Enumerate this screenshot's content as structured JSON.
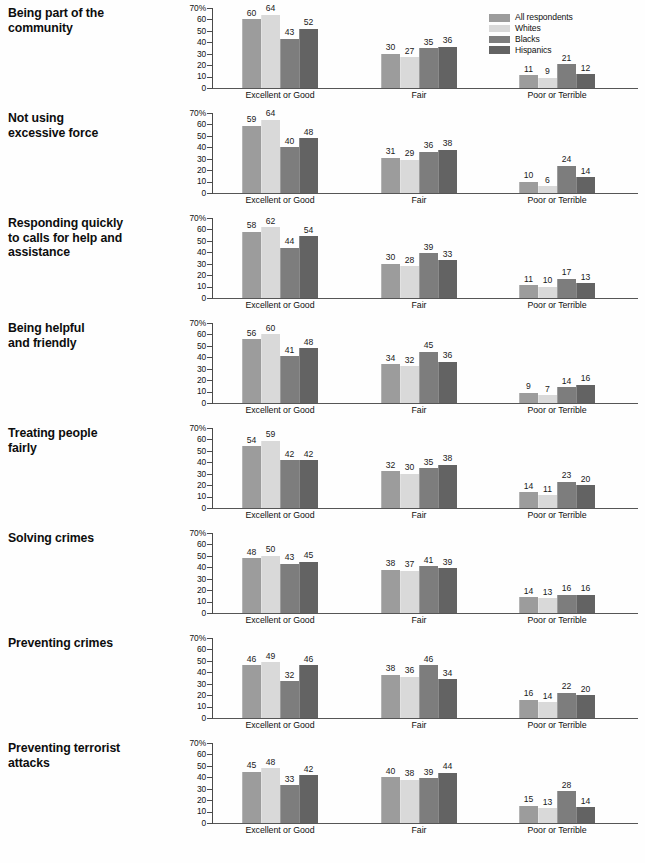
{
  "legend": {
    "items": [
      {
        "label": "All respondents",
        "color": "#9c9c9c"
      },
      {
        "label": "Whites",
        "color": "#d9d9d9"
      },
      {
        "label": "Blacks",
        "color": "#7d7d7d"
      },
      {
        "label": "Hispanics",
        "color": "#636363"
      }
    ]
  },
  "axis": {
    "ticks": [
      "70%",
      "60",
      "50",
      "40",
      "30",
      "20",
      "10",
      "0"
    ],
    "max": 70,
    "min": 0
  },
  "categories": [
    "Excellent or Good",
    "Fair",
    "Poor or Terrible"
  ],
  "chart_data": {
    "type": "bar",
    "title": "",
    "xlabel": "",
    "ylabel": "",
    "ylim": [
      0,
      70
    ],
    "grid": false,
    "legend_position": "top-right",
    "categories": [
      "Excellent or Good",
      "Fair",
      "Poor or Terrible"
    ],
    "series_names": [
      "All respondents",
      "Whites",
      "Blacks",
      "Hispanics"
    ],
    "panels": [
      {
        "label": "Being part of the\ncommunity",
        "label_lines": [
          "Being part of the",
          "community"
        ],
        "groups": [
          {
            "category": "Excellent or Good",
            "values": [
              60,
              64,
              43,
              52
            ]
          },
          {
            "category": "Fair",
            "values": [
              30,
              27,
              35,
              36
            ]
          },
          {
            "category": "Poor or Terrible",
            "values": [
              11,
              9,
              21,
              12
            ]
          }
        ]
      },
      {
        "label": "Not using\nexcessive force",
        "label_lines": [
          "Not using",
          "excessive force"
        ],
        "groups": [
          {
            "category": "Excellent or Good",
            "values": [
              59,
              64,
              40,
              48
            ]
          },
          {
            "category": "Fair",
            "values": [
              31,
              29,
              36,
              38
            ]
          },
          {
            "category": "Poor or Terrible",
            "values": [
              10,
              6,
              24,
              14
            ]
          }
        ]
      },
      {
        "label": "Responding quickly\nto calls for help and\nassistance",
        "label_lines": [
          "Responding quickly",
          "to calls for help and",
          "assistance"
        ],
        "groups": [
          {
            "category": "Excellent or Good",
            "values": [
              58,
              62,
              44,
              54
            ]
          },
          {
            "category": "Fair",
            "values": [
              30,
              28,
              39,
              33
            ]
          },
          {
            "category": "Poor or Terrible",
            "values": [
              11,
              10,
              17,
              13
            ]
          }
        ]
      },
      {
        "label": "Being helpful\nand friendly",
        "label_lines": [
          "Being helpful",
          "and friendly"
        ],
        "groups": [
          {
            "category": "Excellent or Good",
            "values": [
              56,
              60,
              41,
              48
            ]
          },
          {
            "category": "Fair",
            "values": [
              34,
              32,
              45,
              36
            ]
          },
          {
            "category": "Poor or Terrible",
            "values": [
              9,
              7,
              14,
              16
            ]
          }
        ]
      },
      {
        "label": "Treating people\nfairly",
        "label_lines": [
          "Treating people",
          "fairly"
        ],
        "groups": [
          {
            "category": "Excellent or Good",
            "values": [
              54,
              59,
              42,
              42
            ]
          },
          {
            "category": "Fair",
            "values": [
              32,
              30,
              35,
              38
            ]
          },
          {
            "category": "Poor or Terrible",
            "values": [
              14,
              11,
              23,
              20
            ]
          }
        ]
      },
      {
        "label": "Solving crimes",
        "label_lines": [
          "Solving crimes"
        ],
        "groups": [
          {
            "category": "Excellent or Good",
            "values": [
              48,
              50,
              43,
              45
            ]
          },
          {
            "category": "Fair",
            "values": [
              38,
              37,
              41,
              39
            ]
          },
          {
            "category": "Poor or Terrible",
            "values": [
              14,
              13,
              16,
              16
            ]
          }
        ]
      },
      {
        "label": "Preventing crimes",
        "label_lines": [
          "Preventing crimes"
        ],
        "groups": [
          {
            "category": "Excellent or Good",
            "values": [
              46,
              49,
              32,
              46
            ]
          },
          {
            "category": "Fair",
            "values": [
              38,
              36,
              46,
              34
            ]
          },
          {
            "category": "Poor or Terrible",
            "values": [
              16,
              14,
              22,
              20
            ]
          }
        ]
      },
      {
        "label": "Preventing terrorist\nattacks",
        "label_lines": [
          "Preventing terrorist",
          "attacks"
        ],
        "groups": [
          {
            "category": "Excellent or Good",
            "values": [
              45,
              48,
              33,
              42
            ]
          },
          {
            "category": "Fair",
            "values": [
              40,
              38,
              39,
              44
            ]
          },
          {
            "category": "Poor or Terrible",
            "values": [
              15,
              13,
              28,
              14
            ]
          }
        ]
      }
    ]
  }
}
